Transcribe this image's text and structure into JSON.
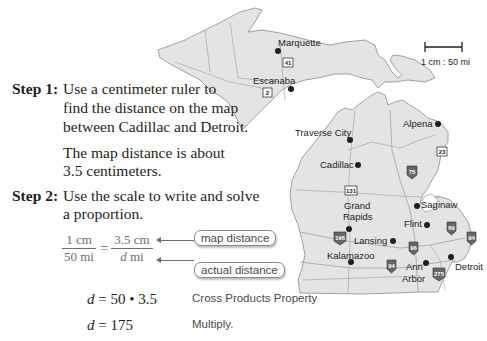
{
  "map": {
    "scale_label": "1 cm : 50 mi",
    "cities": [
      {
        "name": "Marquette"
      },
      {
        "name": "Escanaba"
      },
      {
        "name": "Traverse City"
      },
      {
        "name": "Alpena"
      },
      {
        "name": "Cadillac"
      },
      {
        "name": "Saginaw"
      },
      {
        "name": "Grand Rapids",
        "line1": "Grand",
        "line2": "Rapids"
      },
      {
        "name": "Flint"
      },
      {
        "name": "Lansing"
      },
      {
        "name": "Kalamazoo"
      },
      {
        "name": "Ann Arbor",
        "line1": "Ann",
        "line2": "Arbor"
      },
      {
        "name": "Detroit"
      }
    ],
    "highway_shields": [
      "41",
      "2",
      "23",
      "75",
      "131",
      "196",
      "69",
      "94",
      "96",
      "94",
      "275"
    ]
  },
  "step1": {
    "label": "Step 1:",
    "lines": [
      "Use a centimeter ruler to",
      "find the distance on the map",
      "between Cadillac and Detroit."
    ],
    "result_lines": [
      "The map distance is about",
      "3.5 centimeters."
    ]
  },
  "step2": {
    "label": "Step 2:",
    "lines": [
      "Use the scale to write and solve",
      "a proportion."
    ],
    "proportion": {
      "left_num": "1 cm",
      "left_den": "50 mi",
      "equals": "=",
      "right_num": "3.5 cm",
      "right_den_var": "d",
      "right_den_unit": " mi"
    },
    "callouts": {
      "top": "map distance",
      "bottom": "actual distance"
    },
    "work": [
      {
        "var": "d",
        "expr": " = 50 • 3.5",
        "reason": "Cross Products Property"
      },
      {
        "var": "d",
        "expr": " = 175",
        "reason": "Multiply."
      }
    ]
  }
}
